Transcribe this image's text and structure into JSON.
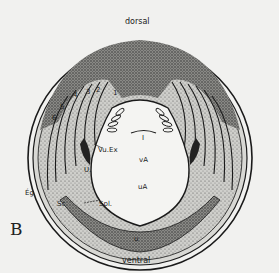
{
  "figure": {
    "panel_label": "B",
    "orientation": {
      "top": "dorsal",
      "bottom": "ventral"
    },
    "labels": {
      "vu_ex": "Vu.Ex",
      "u_left": "U.",
      "eg": "Ég",
      "sc": "Sc",
      "spl": "Spl.",
      "va": "vA",
      "ua": "uA",
      "u_bottom": "u",
      "center_mark": "I"
    },
    "somite_numbers": [
      "1",
      "2",
      "3",
      "4",
      "5",
      "6"
    ],
    "colors": {
      "background": "#f1f1ef",
      "ink": "#1a1a1a",
      "stipple_dark": "#6a6a6a",
      "stipple_light": "#b8b8b4",
      "cavity": "#f4f4f2"
    }
  }
}
